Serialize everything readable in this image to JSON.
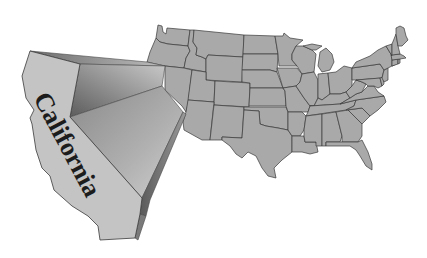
{
  "map": {
    "title": "Contiguous United States with California highlighted",
    "highlighted_state": "California",
    "label": "California",
    "colors": {
      "background": "#ffffff",
      "state_fill": "#a9a9a9",
      "state_border": "#3a3a3a",
      "highlight_face": "#c4c4c4",
      "label_text": "#1c1c1c"
    },
    "regions": [
      "Washington",
      "Oregon",
      "Idaho",
      "Montana",
      "Wyoming",
      "Nevada",
      "Utah",
      "Colorado",
      "Arizona",
      "New Mexico",
      "North Dakota",
      "South Dakota",
      "Nebraska",
      "Kansas",
      "Oklahoma",
      "Texas",
      "Minnesota",
      "Iowa",
      "Missouri",
      "Arkansas",
      "Louisiana",
      "Wisconsin",
      "Illinois",
      "Michigan",
      "Indiana",
      "Ohio",
      "Kentucky",
      "Tennessee",
      "Mississippi",
      "Alabama",
      "Georgia",
      "Florida",
      "South Carolina",
      "North Carolina",
      "Virginia",
      "West Virginia",
      "Pennsylvania",
      "New York",
      "Maryland",
      "Delaware",
      "New Jersey",
      "Connecticut",
      "Rhode Island",
      "Massachusetts",
      "Vermont",
      "New Hampshire",
      "Maine"
    ]
  }
}
